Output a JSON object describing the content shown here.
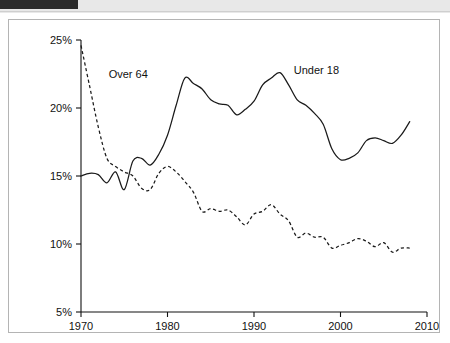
{
  "header": {
    "tab_label": "",
    "caption": ""
  },
  "chart_data": {
    "type": "line",
    "title": "",
    "xlabel": "",
    "ylabel": "",
    "xlim": [
      1970,
      2010
    ],
    "ylim": [
      5,
      25
    ],
    "grid": false,
    "legend_position": "inline-annotation",
    "x_ticks": [
      "1970",
      "1980",
      "1990",
      "2000",
      "2010"
    ],
    "x_tick_values": [
      1970,
      1980,
      1990,
      2000,
      2010
    ],
    "y_ticks": [
      "5%",
      "10%",
      "15%",
      "20%",
      "25%"
    ],
    "y_tick_values": [
      5,
      10,
      15,
      20,
      25
    ],
    "annotations": [
      {
        "text": "Over 64",
        "x": 1973.2,
        "y": 22.2
      },
      {
        "text": "Under 18",
        "x": 1994.6,
        "y": 22.5
      }
    ],
    "series": [
      {
        "name": "Under 18",
        "style": "solid",
        "x": [
          1970,
          1971,
          1972,
          1973,
          1974,
          1975,
          1976,
          1977,
          1978,
          1979,
          1980,
          1981,
          1982,
          1983,
          1984,
          1985,
          1986,
          1987,
          1988,
          1989,
          1990,
          1991,
          1992,
          1993,
          1994,
          1995,
          1996,
          1997,
          1998,
          1999,
          2000,
          2001,
          2002,
          2003,
          2004,
          2005,
          2006,
          2007,
          2008
        ],
        "values": [
          15.0,
          15.2,
          15.1,
          14.5,
          15.3,
          14.0,
          16.1,
          16.3,
          15.8,
          16.6,
          18.0,
          20.2,
          22.2,
          21.8,
          21.4,
          20.6,
          20.3,
          20.2,
          19.5,
          19.9,
          20.5,
          21.7,
          22.2,
          22.6,
          21.7,
          20.6,
          20.2,
          19.6,
          18.8,
          17.0,
          16.2,
          16.3,
          16.7,
          17.6,
          17.8,
          17.6,
          17.4,
          18.0,
          19.0
        ]
      },
      {
        "name": "Over 64",
        "style": "dashed",
        "x": [
          1970,
          1971,
          1972,
          1973,
          1974,
          1975,
          1976,
          1977,
          1978,
          1979,
          1980,
          1981,
          1982,
          1983,
          1984,
          1985,
          1986,
          1987,
          1988,
          1989,
          1990,
          1991,
          1992,
          1993,
          1994,
          1995,
          1996,
          1997,
          1998,
          1999,
          2000,
          2001,
          2002,
          2003,
          2004,
          2005,
          2006,
          2007,
          2008
        ],
        "values": [
          24.6,
          21.6,
          18.6,
          16.3,
          15.7,
          15.3,
          15.0,
          14.1,
          14.0,
          15.2,
          15.7,
          15.3,
          14.6,
          13.8,
          12.4,
          12.6,
          12.4,
          12.5,
          12.0,
          11.4,
          12.2,
          12.4,
          12.9,
          12.2,
          11.7,
          10.5,
          10.8,
          10.5,
          10.5,
          9.7,
          9.9,
          10.1,
          10.4,
          10.2,
          9.8,
          10.1,
          9.4,
          9.7,
          9.7
        ]
      }
    ]
  }
}
